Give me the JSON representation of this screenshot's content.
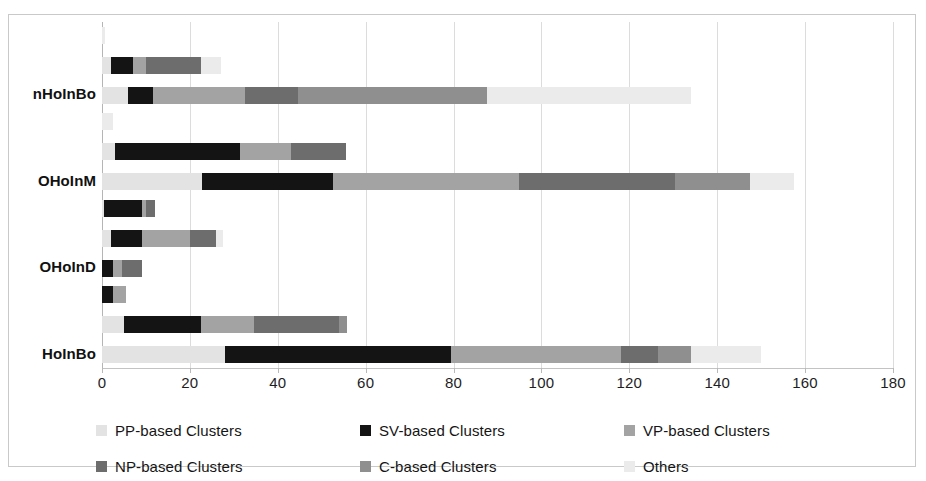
{
  "chart_data": {
    "type": "bar",
    "orientation": "horizontal",
    "stacked": true,
    "title": "",
    "xlabel": "",
    "ylabel": "",
    "xlim": [
      0,
      180
    ],
    "xticks": [
      0,
      20,
      40,
      60,
      80,
      100,
      120,
      140,
      160,
      180
    ],
    "grid": true,
    "legend_position": "bottom",
    "categories": [
      "nHoInBo",
      "OHoInM",
      "OHoInD",
      "HoInBo"
    ],
    "series": [
      {
        "name": "PP-based Clusters",
        "color": "#e3e3e3"
      },
      {
        "name": "SV-based Clusters",
        "color": "#141414"
      },
      {
        "name": "VP-based Clusters",
        "color": "#a3a3a3"
      },
      {
        "name": "NP-based Clusters",
        "color": "#6d6d6d"
      },
      {
        "name": "C-based Clusters",
        "color": "#8f8f8f"
      },
      {
        "name": "Others",
        "color": "#ebebeb"
      }
    ],
    "groups": [
      {
        "category": "nHoInBo",
        "bars": [
          {
            "index": 0,
            "values": [
              0,
              0,
              0,
              0,
              0,
              0.6
            ],
            "total": 0.6
          },
          {
            "index": 1,
            "values": [
              2.0,
              5.0,
              3.0,
              12.5,
              0,
              4.5
            ],
            "total": 27.0
          },
          {
            "index": 2,
            "values": [
              6.0,
              5.5,
              21.0,
              12.0,
              43.0,
              46.5
            ],
            "total": 134.0
          }
        ]
      },
      {
        "category": "OHoInM",
        "bars": [
          {
            "index": 0,
            "values": [
              0,
              0,
              0,
              0,
              0,
              2.5
            ],
            "total": 2.5
          },
          {
            "index": 1,
            "values": [
              3.0,
              28.5,
              11.5,
              12.5,
              0,
              0
            ],
            "total": 55.5
          },
          {
            "index": 2,
            "values": [
              22.8,
              29.7,
              42.5,
              35.5,
              17.0,
              10.0
            ],
            "total": 157.5
          }
        ]
      },
      {
        "category": "OHoInD",
        "bars": [
          {
            "index": 0,
            "values": [
              0.5,
              8.5,
              1.0,
              2.0,
              0,
              0
            ],
            "total": 12.0
          },
          {
            "index": 1,
            "values": [
              2.0,
              7.0,
              11.0,
              6.0,
              0,
              1.5
            ],
            "total": 27.5
          },
          {
            "index": 2,
            "values": [
              0,
              2.5,
              2.0,
              4.5,
              0,
              0
            ],
            "total": 9.0
          }
        ]
      },
      {
        "category": "HoInBo",
        "bars": [
          {
            "index": 0,
            "values": [
              0,
              2.5,
              3.0,
              0,
              0,
              0
            ],
            "total": 5.5
          },
          {
            "index": 1,
            "values": [
              5.0,
              17.5,
              12.0,
              19.5,
              1.8,
              0
            ],
            "total": 55.8
          },
          {
            "index": 2,
            "values": [
              28.0,
              51.5,
              38.5,
              8.5,
              7.5,
              16.0
            ],
            "total": 150.0
          }
        ]
      }
    ]
  },
  "axis": {
    "tick_labels": [
      "0",
      "20",
      "40",
      "60",
      "80",
      "100",
      "120",
      "140",
      "160",
      "180"
    ]
  },
  "legend": {
    "items": [
      {
        "label": "PP-based Clusters",
        "color": "#e3e3e3",
        "icon": "legend-swatch-icon"
      },
      {
        "label": "SV-based Clusters",
        "color": "#141414",
        "icon": "legend-swatch-icon"
      },
      {
        "label": "VP-based Clusters",
        "color": "#a3a3a3",
        "icon": "legend-swatch-icon"
      },
      {
        "label": "NP-based Clusters",
        "color": "#6d6d6d",
        "icon": "legend-swatch-icon"
      },
      {
        "label": "C-based Clusters",
        "color": "#8f8f8f",
        "icon": "legend-swatch-icon"
      },
      {
        "label": "Others",
        "color": "#ebebeb",
        "icon": "legend-swatch-icon"
      }
    ]
  }
}
